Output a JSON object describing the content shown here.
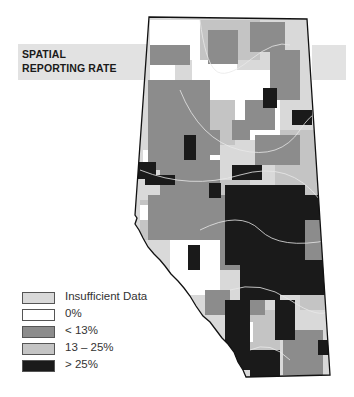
{
  "title": {
    "line1": "SPATIAL",
    "line2": "REPORTING RATE"
  },
  "legend": {
    "items": [
      {
        "label": "Insufficient Data",
        "color": "#d9d9d9"
      },
      {
        "label": "0%",
        "color": "#ffffff"
      },
      {
        "label": "< 13%",
        "color": "#8c8c8c"
      },
      {
        "label": "13 – 25%",
        "color": "#c4c4c4"
      },
      {
        "label": "> 25%",
        "color": "#1a1a1a"
      }
    ]
  },
  "colors": {
    "insufficient": "#d9d9d9",
    "zero": "#ffffff",
    "low": "#8c8c8c",
    "mid": "#c4c4c4",
    "high": "#1a1a1a",
    "outline": "#111111",
    "rivers": "#e8e8e8",
    "band": "#e2e2e2"
  }
}
